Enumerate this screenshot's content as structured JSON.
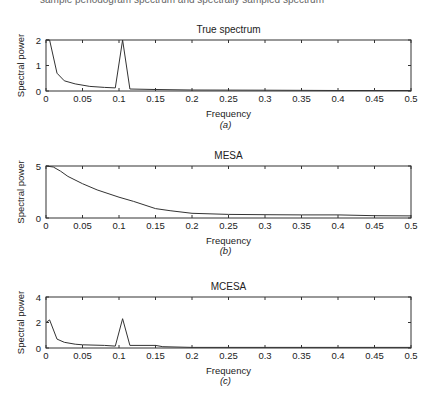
{
  "header_fragment": "sample periodogram spectrum and spectrally sampled spectrum",
  "chart_data": [
    {
      "type": "line",
      "title": "True spectrum",
      "subtitle": "(a)",
      "xlabel": "Frequency",
      "ylabel": "Spectral power",
      "xlim": [
        0,
        0.5
      ],
      "ylim": [
        0,
        2
      ],
      "xticks": [
        "0",
        "0.05",
        "0.1",
        "0.15",
        "0.2",
        "0.25",
        "0.3",
        "0.35",
        "0.4",
        "0.45",
        "0.5"
      ],
      "yticks": [
        "0",
        "1",
        "2"
      ],
      "grid": false,
      "x": [
        0,
        0.005,
        0.015,
        0.025,
        0.04,
        0.06,
        0.08,
        0.095,
        0.105,
        0.115,
        0.15,
        0.2,
        0.3,
        0.4,
        0.5
      ],
      "y": [
        2.0,
        2.0,
        0.7,
        0.4,
        0.28,
        0.18,
        0.14,
        0.12,
        2.0,
        0.08,
        0.06,
        0.04,
        0.03,
        0.02,
        0.02
      ]
    },
    {
      "type": "line",
      "title": "MESA",
      "subtitle": "(b)",
      "xlabel": "Frequency",
      "ylabel": "Spectral power",
      "xlim": [
        0,
        0.5
      ],
      "ylim": [
        0,
        5
      ],
      "xticks": [
        "0",
        "0.05",
        "0.1",
        "0.15",
        "0.2",
        "0.25",
        "0.3",
        "0.35",
        "0.4",
        "0.45",
        "0.5"
      ],
      "yticks": [
        "0",
        "5"
      ],
      "grid": false,
      "x": [
        0,
        0.01,
        0.02,
        0.03,
        0.05,
        0.07,
        0.1,
        0.12,
        0.15,
        0.17,
        0.2,
        0.25,
        0.3,
        0.35,
        0.4,
        0.45,
        0.5
      ],
      "y": [
        5.0,
        4.9,
        4.5,
        4.0,
        3.3,
        2.7,
        2.0,
        1.6,
        0.9,
        0.7,
        0.45,
        0.35,
        0.32,
        0.3,
        0.3,
        0.22,
        0.2
      ]
    },
    {
      "type": "line",
      "title": "MCESA",
      "subtitle": "(c)",
      "xlabel": "Frequency",
      "ylabel": "Spectral power",
      "xlim": [
        0,
        0.5
      ],
      "ylim": [
        0,
        4
      ],
      "xticks": [
        "0",
        "0.05",
        "0.1",
        "0.15",
        "0.2",
        "0.25",
        "0.3",
        "0.35",
        "0.4",
        "0.45",
        "0.5"
      ],
      "yticks": [
        "0",
        "2",
        "4"
      ],
      "grid": false,
      "x": [
        0,
        0.005,
        0.015,
        0.025,
        0.04,
        0.05,
        0.08,
        0.095,
        0.105,
        0.115,
        0.15,
        0.16,
        0.2,
        0.3,
        0.4,
        0.5
      ],
      "y": [
        2.0,
        2.2,
        0.7,
        0.45,
        0.3,
        0.25,
        0.2,
        0.15,
        2.3,
        0.2,
        0.2,
        0.1,
        0.05,
        0.05,
        0.05,
        0.05
      ]
    }
  ]
}
